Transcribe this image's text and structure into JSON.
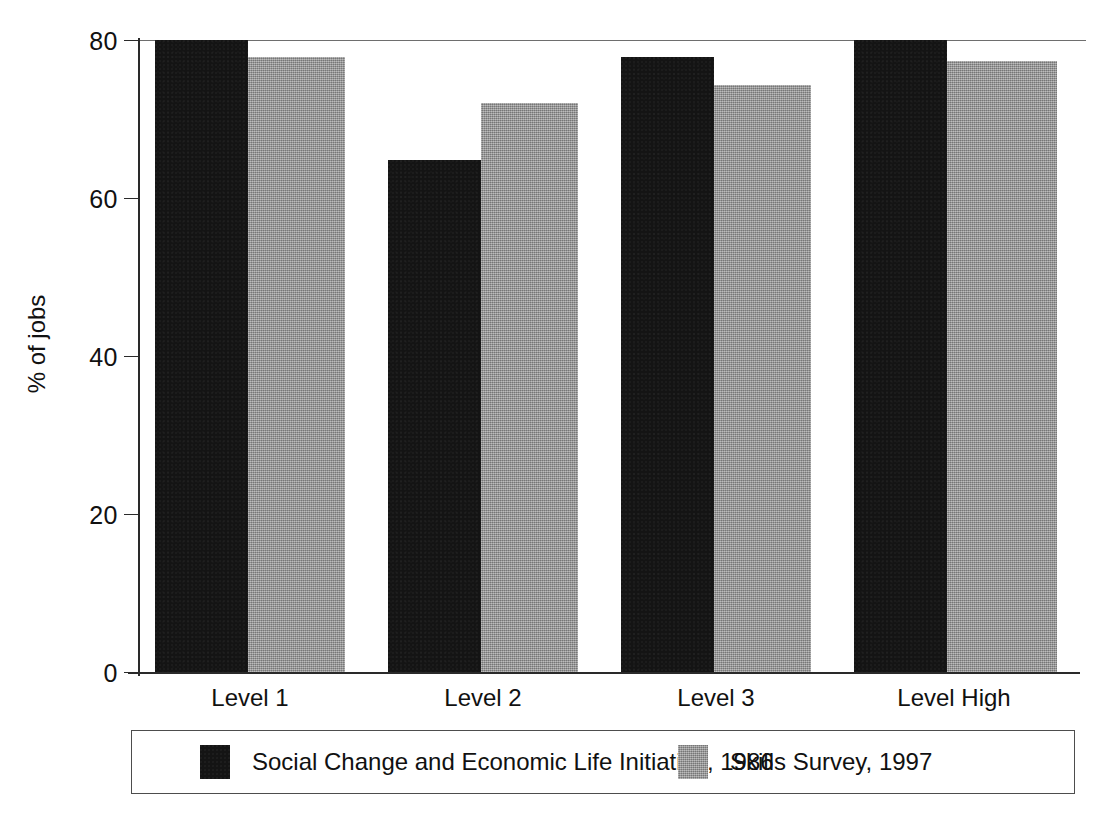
{
  "chart_data": {
    "type": "bar",
    "title": "",
    "subtitle": "",
    "xlabel": "",
    "ylabel": "% of jobs",
    "ylim": [
      0,
      80
    ],
    "yticks": [
      0,
      20,
      40,
      60,
      80
    ],
    "ytick_labels": [
      "0",
      "20",
      "40",
      "60",
      "80"
    ],
    "grid": false,
    "legend_position": "bottom",
    "categories": [
      "Level 1",
      "Level 2",
      "Level 3",
      "Level High"
    ],
    "series": [
      {
        "name": "Social Change and Economic Life Initiative, 1986",
        "color": "#141414",
        "values": [
          80.0,
          64.8,
          77.8,
          80.0
        ]
      },
      {
        "name": "Skills Survey, 1997",
        "color": "#999999",
        "values": [
          77.8,
          72.0,
          74.3,
          77.3
        ]
      }
    ]
  },
  "axis": {
    "y_title": "% of jobs",
    "y_tick_labels": [
      "80",
      "60",
      "40",
      "20",
      "0"
    ]
  },
  "x_labels": [
    "Level 1",
    "Level 2",
    "Level 3",
    "Level High"
  ],
  "legend": {
    "entries": [
      {
        "label": "Social Change and Economic Life Initiative, 1986",
        "swatch": "black-swatch"
      },
      {
        "label": "Skills Survey, 1997",
        "swatch": "gray-swatch"
      }
    ]
  }
}
